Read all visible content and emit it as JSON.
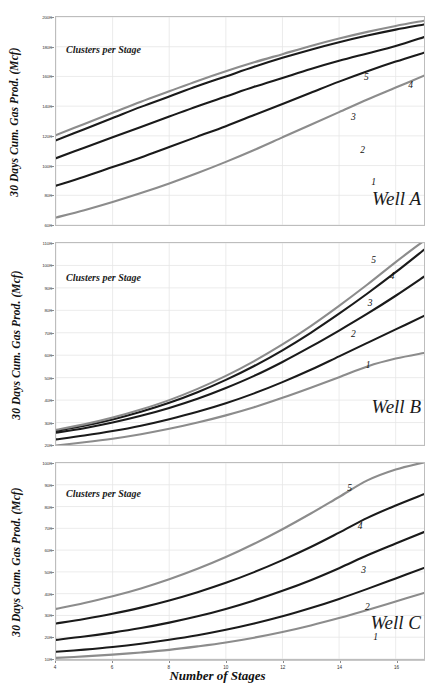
{
  "figure": {
    "xlabel": "Number of Stages",
    "ylabel": "30 Days Cum. Gas Prod. (Mcf)",
    "legend_title": "Clusters per Stage",
    "xticks": [
      "4",
      "6",
      "8",
      "10",
      "12",
      "14",
      "16"
    ],
    "colors": {
      "black": "#1a1a1a",
      "gray": "#8c8c8c",
      "grid": "#e6e6e6",
      "frame": "#bdbdbd"
    }
  },
  "panels": [
    {
      "id": "a",
      "name": "Well A",
      "yticks": [
        "60K",
        "80K",
        "100K",
        "120K",
        "140K",
        "160K",
        "180K",
        "200K"
      ]
    },
    {
      "id": "b",
      "name": "Well B",
      "yticks": [
        "20K",
        "30K",
        "40K",
        "50K",
        "60K",
        "70K",
        "80K",
        "90K",
        "100K",
        "110K"
      ]
    },
    {
      "id": "c",
      "name": "Well C",
      "yticks": [
        "10K",
        "20K",
        "30K",
        "40K",
        "50K",
        "60K",
        "70K",
        "80K",
        "90K",
        "100K"
      ]
    }
  ],
  "curve_labels": [
    "1",
    "2",
    "3",
    "4",
    "5"
  ],
  "chart_data": [
    {
      "type": "line",
      "title": "Well A",
      "xlabel": "Number of Stages",
      "ylabel": "30 Days Cum. Gas Prod. (Mcf)",
      "legend_title": "Clusters per Stage",
      "legend_position": "inline-right-end-of-curve",
      "grid": true,
      "xlim": [
        4,
        17
      ],
      "ylim": [
        60000,
        200000
      ],
      "ytick_values": [
        60000,
        80000,
        100000,
        120000,
        140000,
        160000,
        180000,
        200000
      ],
      "x": [
        4,
        5,
        6,
        7,
        8,
        9,
        10,
        11,
        12,
        13,
        14,
        15,
        16,
        17
      ],
      "series": [
        {
          "name": "1",
          "color": "#8c8c8c",
          "values": [
            65000,
            70000,
            75500,
            81500,
            88000,
            95000,
            102500,
            110500,
            119000,
            127500,
            136000,
            144500,
            152500,
            160500
          ]
        },
        {
          "name": "2",
          "color": "#1a1a1a",
          "values": [
            86500,
            92500,
            99000,
            105500,
            112500,
            119500,
            126500,
            134000,
            141500,
            149000,
            156500,
            163500,
            170000,
            176000
          ]
        },
        {
          "name": "3",
          "color": "#1a1a1a",
          "values": [
            105000,
            112000,
            119000,
            126000,
            133000,
            140000,
            146500,
            153000,
            159000,
            165000,
            170500,
            175500,
            180500,
            186500
          ]
        },
        {
          "name": "4",
          "color": "#1a1a1a",
          "values": [
            117000,
            124500,
            132000,
            139500,
            146500,
            153500,
            160000,
            166500,
            172500,
            178000,
            183000,
            187500,
            191500,
            195000
          ]
        },
        {
          "name": "5",
          "color": "#8c8c8c",
          "values": [
            120500,
            128000,
            135500,
            143000,
            150000,
            157000,
            163500,
            169500,
            175000,
            180500,
            185500,
            190000,
            194000,
            197500
          ]
        }
      ]
    },
    {
      "type": "line",
      "title": "Well B",
      "xlabel": "Number of Stages",
      "ylabel": "30 Days Cum. Gas Prod. (Mcf)",
      "legend_title": "Clusters per Stage",
      "legend_position": "inline-right-end-of-curve",
      "grid": true,
      "xlim": [
        4,
        17
      ],
      "ylim": [
        20000,
        110000
      ],
      "ytick_values": [
        20000,
        30000,
        40000,
        50000,
        60000,
        70000,
        80000,
        90000,
        100000,
        110000
      ],
      "x": [
        4,
        5,
        6,
        7,
        8,
        9,
        10,
        11,
        12,
        13,
        14,
        15,
        16,
        17
      ],
      "series": [
        {
          "name": "1",
          "color": "#8c8c8c",
          "values": [
            19800,
            21200,
            22800,
            24800,
            27200,
            30000,
            33200,
            36800,
            41000,
            45500,
            50200,
            55000,
            58500,
            61000
          ]
        },
        {
          "name": "2",
          "color": "#1a1a1a",
          "values": [
            22500,
            24200,
            26200,
            28600,
            31500,
            34800,
            38600,
            43000,
            48000,
            53500,
            59500,
            65500,
            71500,
            77500
          ]
        },
        {
          "name": "3",
          "color": "#1a1a1a",
          "values": [
            25500,
            27500,
            30000,
            33000,
            36500,
            40600,
            45400,
            50800,
            57000,
            63800,
            71000,
            78500,
            86500,
            95000
          ]
        },
        {
          "name": "4",
          "color": "#1a1a1a",
          "values": [
            26300,
            28600,
            31400,
            34800,
            38800,
            43500,
            49000,
            55200,
            62200,
            70000,
            78500,
            87500,
            97000,
            107000
          ]
        },
        {
          "name": "5",
          "color": "#8c8c8c",
          "values": [
            26800,
            29200,
            32200,
            35800,
            40000,
            45000,
            50800,
            57400,
            64800,
            73000,
            82000,
            91500,
            101500,
            111000
          ]
        }
      ]
    },
    {
      "type": "line",
      "title": "Well C",
      "xlabel": "Number of Stages",
      "ylabel": "30 Days Cum. Gas Prod. (Mcf)",
      "legend_title": "Clusters per Stage",
      "legend_position": "inline-right-end-of-curve",
      "grid": true,
      "xlim": [
        4,
        17
      ],
      "ylim": [
        10000,
        100000
      ],
      "ytick_values": [
        10000,
        20000,
        30000,
        40000,
        50000,
        60000,
        70000,
        80000,
        90000,
        100000
      ],
      "x": [
        4,
        5,
        6,
        7,
        8,
        9,
        10,
        11,
        12,
        13,
        14,
        15,
        16,
        17
      ],
      "series": [
        {
          "name": "1",
          "color": "#8c8c8c",
          "values": [
            10500,
            11200,
            12000,
            13000,
            14200,
            15800,
            17600,
            19800,
            22400,
            25400,
            28800,
            32500,
            36400,
            40300
          ]
        },
        {
          "name": "2",
          "color": "#1a1a1a",
          "values": [
            13300,
            14300,
            15500,
            17000,
            18800,
            20900,
            23400,
            26300,
            29600,
            33400,
            37600,
            42200,
            47000,
            51800
          ]
        },
        {
          "name": "3",
          "color": "#1a1a1a",
          "values": [
            18800,
            20300,
            22100,
            24200,
            26700,
            29600,
            33000,
            36900,
            41300,
            46200,
            51700,
            57600,
            63000,
            68300
          ]
        },
        {
          "name": "4",
          "color": "#1a1a1a",
          "values": [
            26300,
            28400,
            30800,
            33600,
            36900,
            40700,
            45000,
            49900,
            55400,
            61400,
            68000,
            74800,
            80500,
            85700
          ]
        },
        {
          "name": "5",
          "color": "#8c8c8c",
          "values": [
            33000,
            35700,
            38800,
            42400,
            46600,
            51400,
            56800,
            62900,
            69600,
            76800,
            84400,
            92000,
            97000,
            100300
          ]
        }
      ]
    }
  ],
  "curve_label_positions": [
    {
      "panel": "a",
      "labels": [
        {
          "n": "1",
          "x": 0.855,
          "y": 0.765
        },
        {
          "n": "2",
          "x": 0.825,
          "y": 0.612
        },
        {
          "n": "3",
          "x": 0.8,
          "y": 0.455
        },
        {
          "n": "4",
          "x": 0.955,
          "y": 0.305
        },
        {
          "n": "5",
          "x": 0.835,
          "y": 0.268
        }
      ]
    },
    {
      "panel": "b",
      "labels": [
        {
          "n": "1",
          "x": 0.84,
          "y": 0.58
        },
        {
          "n": "2",
          "x": 0.8,
          "y": 0.425
        },
        {
          "n": "3",
          "x": 0.845,
          "y": 0.275
        },
        {
          "n": "4",
          "x": 0.905,
          "y": 0.14
        },
        {
          "n": "5",
          "x": 0.855,
          "y": 0.062
        }
      ]
    },
    {
      "panel": "c",
      "labels": [
        {
          "n": "1",
          "x": 0.86,
          "y": 0.86
        },
        {
          "n": "2",
          "x": 0.838,
          "y": 0.705
        },
        {
          "n": "3",
          "x": 0.828,
          "y": 0.52
        },
        {
          "n": "4",
          "x": 0.818,
          "y": 0.3
        },
        {
          "n": "5",
          "x": 0.79,
          "y": 0.105
        }
      ]
    }
  ]
}
